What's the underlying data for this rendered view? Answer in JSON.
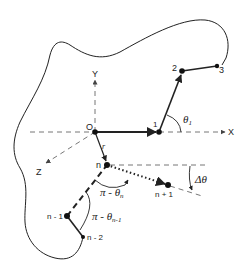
{
  "diagram": {
    "type": "polymer chain in 3D coordinate system with bounding surface",
    "axes": {
      "x_label": "X",
      "y_label": "Y",
      "z_label": "Z",
      "origin_label": "O"
    },
    "nodes": [
      {
        "id": "1",
        "label": "1"
      },
      {
        "id": "2",
        "label": "2"
      },
      {
        "id": "3",
        "label": "3"
      },
      {
        "id": "n-2",
        "label": "n - 2"
      },
      {
        "id": "n-1",
        "label": "n - 1"
      },
      {
        "id": "n",
        "label": "n"
      },
      {
        "id": "n+1",
        "label": "n + 1"
      }
    ],
    "vector_label": "r",
    "angles": {
      "theta1": "θ",
      "theta1_sub": "1",
      "pi_theta_n": "π - θ",
      "pi_theta_n_sub": "n",
      "pi_theta_n_minus_1": "π - θ",
      "pi_theta_n_minus_1_sub": "n-1",
      "delta_theta": "Δθ"
    },
    "colors": {
      "line": "#222222",
      "axis": "#666666",
      "background": "#ffffff"
    }
  }
}
